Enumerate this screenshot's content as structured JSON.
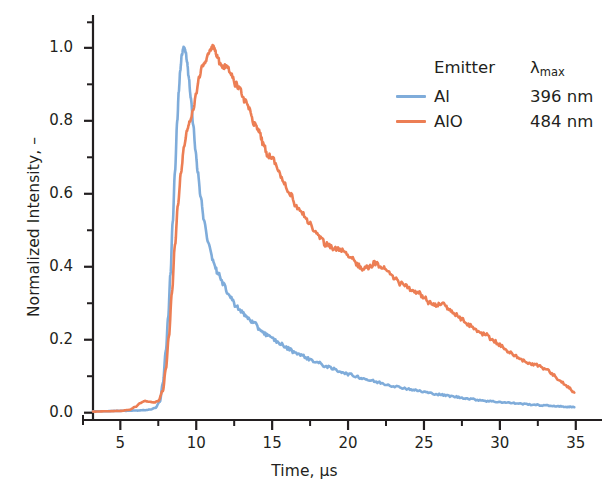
{
  "chart_data": {
    "type": "line",
    "title": "",
    "xlabel": "Time, µs",
    "ylabel": "Normalized Intensity, –",
    "xlim": [
      3.2,
      36.2
    ],
    "ylim": [
      -0.02,
      1.09
    ],
    "xticks": [
      5,
      10,
      15,
      20,
      25,
      30,
      35
    ],
    "xtick_labels": [
      "5",
      "10",
      "15",
      "20",
      "25",
      "30",
      "35"
    ],
    "xminor_ticks": [
      7.5,
      12.5,
      17.5,
      22.5,
      27.5,
      32.5
    ],
    "yticks": [
      0.0,
      0.2,
      0.4,
      0.6,
      0.8,
      1.0
    ],
    "ytick_labels": [
      "0.0",
      "0.2",
      "0.4",
      "0.6",
      "0.8",
      "1.0"
    ],
    "yminor_ticks": [
      0.1,
      0.3,
      0.5,
      0.7,
      0.9,
      1.07
    ],
    "grid": false,
    "legend_position": "upper right",
    "series": [
      {
        "name": "Al",
        "lambda_max": "396 nm",
        "color": "#7FACDA",
        "peak_x": 9.2,
        "peak_y": 1.0,
        "x": [
          3.2,
          4.0,
          4.6,
          5.2,
          5.8,
          6.2,
          6.6,
          7.0,
          7.3,
          7.6,
          7.8,
          8.0,
          8.15,
          8.3,
          8.45,
          8.6,
          8.75,
          8.85,
          8.95,
          9.05,
          9.15,
          9.2,
          9.3,
          9.4,
          9.5,
          9.65,
          9.8,
          9.95,
          10.1,
          10.3,
          10.5,
          10.8,
          11.1,
          11.4,
          11.8,
          12.2,
          12.6,
          13.0,
          13.4,
          13.8,
          14.2,
          14.6,
          15.0,
          15.5,
          16.0,
          16.5,
          17.0,
          17.5,
          18.0,
          18.5,
          19.0,
          19.5,
          20.0,
          20.5,
          21.0,
          21.5,
          22.0,
          22.5,
          23.0,
          23.5,
          24.0,
          24.5,
          25.0,
          25.5,
          26.0,
          26.5,
          27.0,
          27.5,
          28.0,
          28.6,
          29.2,
          29.8,
          30.4,
          31.0,
          31.6,
          32.2,
          32.8,
          33.4,
          34.0,
          34.5,
          34.9
        ],
        "y": [
          0.004,
          0.004,
          0.005,
          0.005,
          0.006,
          0.006,
          0.007,
          0.009,
          0.013,
          0.03,
          0.08,
          0.17,
          0.26,
          0.38,
          0.52,
          0.66,
          0.8,
          0.88,
          0.94,
          0.98,
          1.0,
          1.0,
          0.99,
          0.96,
          0.92,
          0.86,
          0.79,
          0.72,
          0.66,
          0.59,
          0.53,
          0.465,
          0.42,
          0.385,
          0.35,
          0.32,
          0.295,
          0.275,
          0.26,
          0.245,
          0.228,
          0.215,
          0.203,
          0.19,
          0.177,
          0.166,
          0.156,
          0.146,
          0.137,
          0.128,
          0.12,
          0.113,
          0.106,
          0.1,
          0.094,
          0.088,
          0.083,
          0.078,
          0.073,
          0.069,
          0.065,
          0.061,
          0.057,
          0.053,
          0.05,
          0.047,
          0.044,
          0.041,
          0.038,
          0.035,
          0.032,
          0.03,
          0.028,
          0.026,
          0.024,
          0.022,
          0.02,
          0.019,
          0.017,
          0.016,
          0.015
        ]
      },
      {
        "name": "AlO",
        "lambda_max": "484 nm",
        "color": "#EC7E54",
        "peak_x": 11.1,
        "peak_y": 1.0,
        "x": [
          3.2,
          4.2,
          5.0,
          5.6,
          6.0,
          6.3,
          6.6,
          6.9,
          7.2,
          7.5,
          7.8,
          8.0,
          8.2,
          8.4,
          8.6,
          8.8,
          9.0,
          9.2,
          9.4,
          9.6,
          9.8,
          10.0,
          10.2,
          10.4,
          10.6,
          10.8,
          10.95,
          11.1,
          11.25,
          11.4,
          11.6,
          11.8,
          12.0,
          12.3,
          12.6,
          12.9,
          13.2,
          13.5,
          13.8,
          14.1,
          14.4,
          14.7,
          15.0,
          15.4,
          15.8,
          16.2,
          16.6,
          17.0,
          17.4,
          17.8,
          18.2,
          18.6,
          19.0,
          19.4,
          19.8,
          20.2,
          20.6,
          21.0,
          21.4,
          21.8,
          22.2,
          22.6,
          23.0,
          23.4,
          23.8,
          24.2,
          24.6,
          25.0,
          25.4,
          25.8,
          26.2,
          26.6,
          27.0,
          27.5,
          28.0,
          28.5,
          29.0,
          29.5,
          30.0,
          30.5,
          31.0,
          31.5,
          32.0,
          32.5,
          33.0,
          33.5,
          34.0,
          34.5,
          34.9
        ],
        "y": [
          0.003,
          0.004,
          0.005,
          0.008,
          0.016,
          0.026,
          0.032,
          0.03,
          0.028,
          0.032,
          0.06,
          0.12,
          0.21,
          0.33,
          0.46,
          0.57,
          0.66,
          0.73,
          0.775,
          0.8,
          0.83,
          0.875,
          0.92,
          0.95,
          0.96,
          0.985,
          0.995,
          1.0,
          0.99,
          0.975,
          0.955,
          0.945,
          0.955,
          0.93,
          0.9,
          0.885,
          0.855,
          0.83,
          0.79,
          0.775,
          0.74,
          0.705,
          0.7,
          0.665,
          0.63,
          0.6,
          0.565,
          0.545,
          0.52,
          0.5,
          0.475,
          0.46,
          0.45,
          0.447,
          0.44,
          0.425,
          0.405,
          0.395,
          0.4,
          0.41,
          0.4,
          0.385,
          0.37,
          0.355,
          0.35,
          0.335,
          0.33,
          0.315,
          0.3,
          0.295,
          0.3,
          0.285,
          0.27,
          0.255,
          0.24,
          0.225,
          0.215,
          0.2,
          0.185,
          0.17,
          0.155,
          0.145,
          0.135,
          0.13,
          0.12,
          0.105,
          0.085,
          0.07,
          0.055
        ]
      }
    ]
  },
  "legend": {
    "header_emitter": "Emitter",
    "header_lambda_main": "λ",
    "header_lambda_sub": "max",
    "entries": [
      {
        "name": "Al",
        "value": "396 nm"
      },
      {
        "name": "AlO",
        "value": "484 nm"
      }
    ]
  },
  "colors": {
    "al": "#7FACDA",
    "alo": "#EC7E54",
    "axis": "#231f20",
    "text": "#231f20",
    "background": "#ffffff"
  }
}
